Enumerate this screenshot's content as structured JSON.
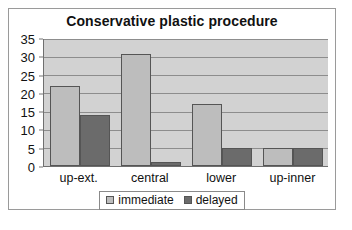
{
  "chart_data": {
    "type": "bar",
    "title": "Conservative plastic procedure",
    "xlabel": "",
    "ylabel": "",
    "categories": [
      "up-ext.",
      "central",
      "lower",
      "up-inner"
    ],
    "series": [
      {
        "name": "immediate",
        "color": "#bdbdbd",
        "values": [
          22,
          31,
          17,
          5
        ]
      },
      {
        "name": "delayed",
        "color": "#6b6b6b",
        "values": [
          14,
          1,
          5,
          5
        ]
      }
    ],
    "ylim": [
      0,
      35
    ],
    "yticks": [
      0,
      5,
      10,
      15,
      20,
      25,
      30,
      35
    ],
    "grid": true,
    "legend_position": "bottom",
    "plot_background": "#d2d2d2",
    "frame_color": "#9a9a9a"
  }
}
